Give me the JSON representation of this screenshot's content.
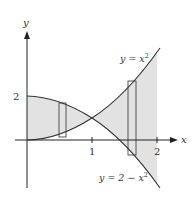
{
  "figure": {
    "axes": {
      "x_label": "x",
      "y_label": "y",
      "x_ticks": [
        "1",
        "2"
      ],
      "y_ticks": [
        "2"
      ]
    },
    "curves": [
      {
        "label_prefix": "y = x",
        "label_sup": "2"
      },
      {
        "label_prefix": "y = 2 − x",
        "label_sup": "2"
      }
    ],
    "colors": {
      "shade": "#e2e2e2",
      "line": "#333333",
      "axis": "#222222"
    }
  }
}
